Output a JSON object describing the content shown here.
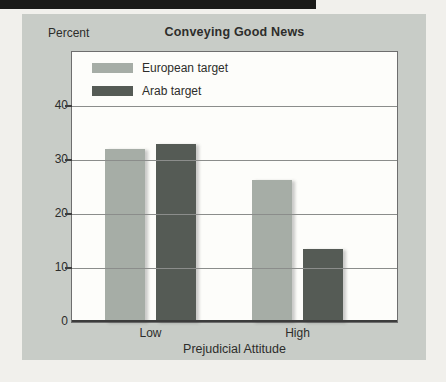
{
  "figure": {
    "has_top_black_bar": true
  },
  "chart_data": {
    "type": "bar",
    "title": "Conveying Good News",
    "ylabel": "Percent",
    "xlabel": "Prejudicial Attitude",
    "categories": [
      "Low",
      "High"
    ],
    "series": [
      {
        "name": "European target",
        "values": [
          32,
          26.3
        ],
        "color": "#a6ada6"
      },
      {
        "name": "Arab target",
        "values": [
          33,
          13.5
        ],
        "color": "#555b55"
      }
    ],
    "ylim": [
      0,
      50
    ],
    "yticks": [
      0,
      10,
      20,
      30,
      40
    ],
    "grid": true,
    "gridlines_over_bars": true,
    "legend_position": "top-left",
    "colors": {
      "page_bg": "#f1f0ec",
      "top_bar": "#1a1a18",
      "panel_bg": "#c8ccc7",
      "plot_bg": "#fdfdfa",
      "gridline": "#8b8d8b",
      "frame": "#6e6e6e",
      "axis": "#3c3c3c",
      "text": "#2d2d2b"
    }
  }
}
